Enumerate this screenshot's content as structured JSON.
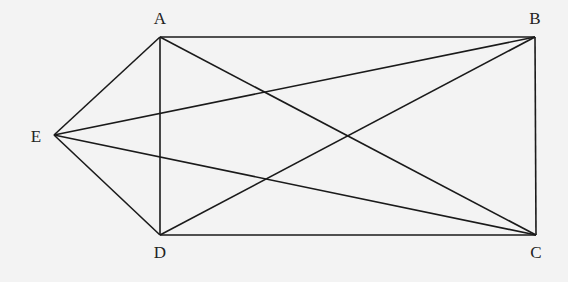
{
  "diagram": {
    "type": "geometry",
    "background": "#f3f3f3",
    "stroke_color": "#1a1a1a",
    "points": {
      "A": {
        "label": "A",
        "x": 160,
        "y": 37,
        "label_x": 160,
        "label_y": 18
      },
      "B": {
        "label": "B",
        "x": 535,
        "y": 37,
        "label_x": 535,
        "label_y": 18
      },
      "C": {
        "label": "C",
        "x": 536,
        "y": 235,
        "label_x": 536,
        "label_y": 252
      },
      "D": {
        "label": "D",
        "x": 160,
        "y": 235,
        "label_x": 160,
        "label_y": 252
      },
      "E": {
        "label": "E",
        "x": 54,
        "y": 135,
        "label_x": 36,
        "label_y": 136
      }
    },
    "segments": [
      [
        "A",
        "B"
      ],
      [
        "B",
        "C"
      ],
      [
        "C",
        "D"
      ],
      [
        "D",
        "A"
      ],
      [
        "A",
        "C"
      ],
      [
        "B",
        "D"
      ],
      [
        "E",
        "A"
      ],
      [
        "E",
        "B"
      ],
      [
        "E",
        "C"
      ],
      [
        "E",
        "D"
      ]
    ]
  }
}
